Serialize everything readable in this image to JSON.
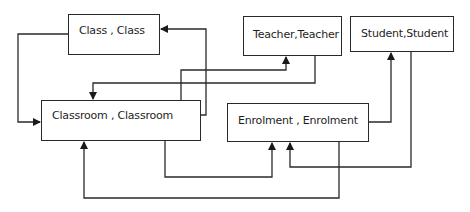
{
  "diagram": {
    "type": "entity-relationship",
    "line_color": "#2a2a2a",
    "entities": [
      {
        "id": "class",
        "label": "Class , Class"
      },
      {
        "id": "teacher",
        "label": "Teacher,Teacher"
      },
      {
        "id": "student",
        "label": "Student,Student"
      },
      {
        "id": "classroom",
        "label": "Classroom , Classroom"
      },
      {
        "id": "enrolment",
        "label": "Enrolment , Enrolment"
      }
    ],
    "connections": [
      {
        "from": "class",
        "to": "classroom"
      },
      {
        "from": "classroom",
        "to": "class"
      },
      {
        "from": "classroom",
        "to": "teacher"
      },
      {
        "from": "teacher",
        "to": "classroom"
      },
      {
        "from": "classroom",
        "to": "enrolment"
      },
      {
        "from": "enrolment",
        "to": "classroom"
      },
      {
        "from": "enrolment",
        "to": "student"
      },
      {
        "from": "student",
        "to": "enrolment"
      }
    ]
  }
}
